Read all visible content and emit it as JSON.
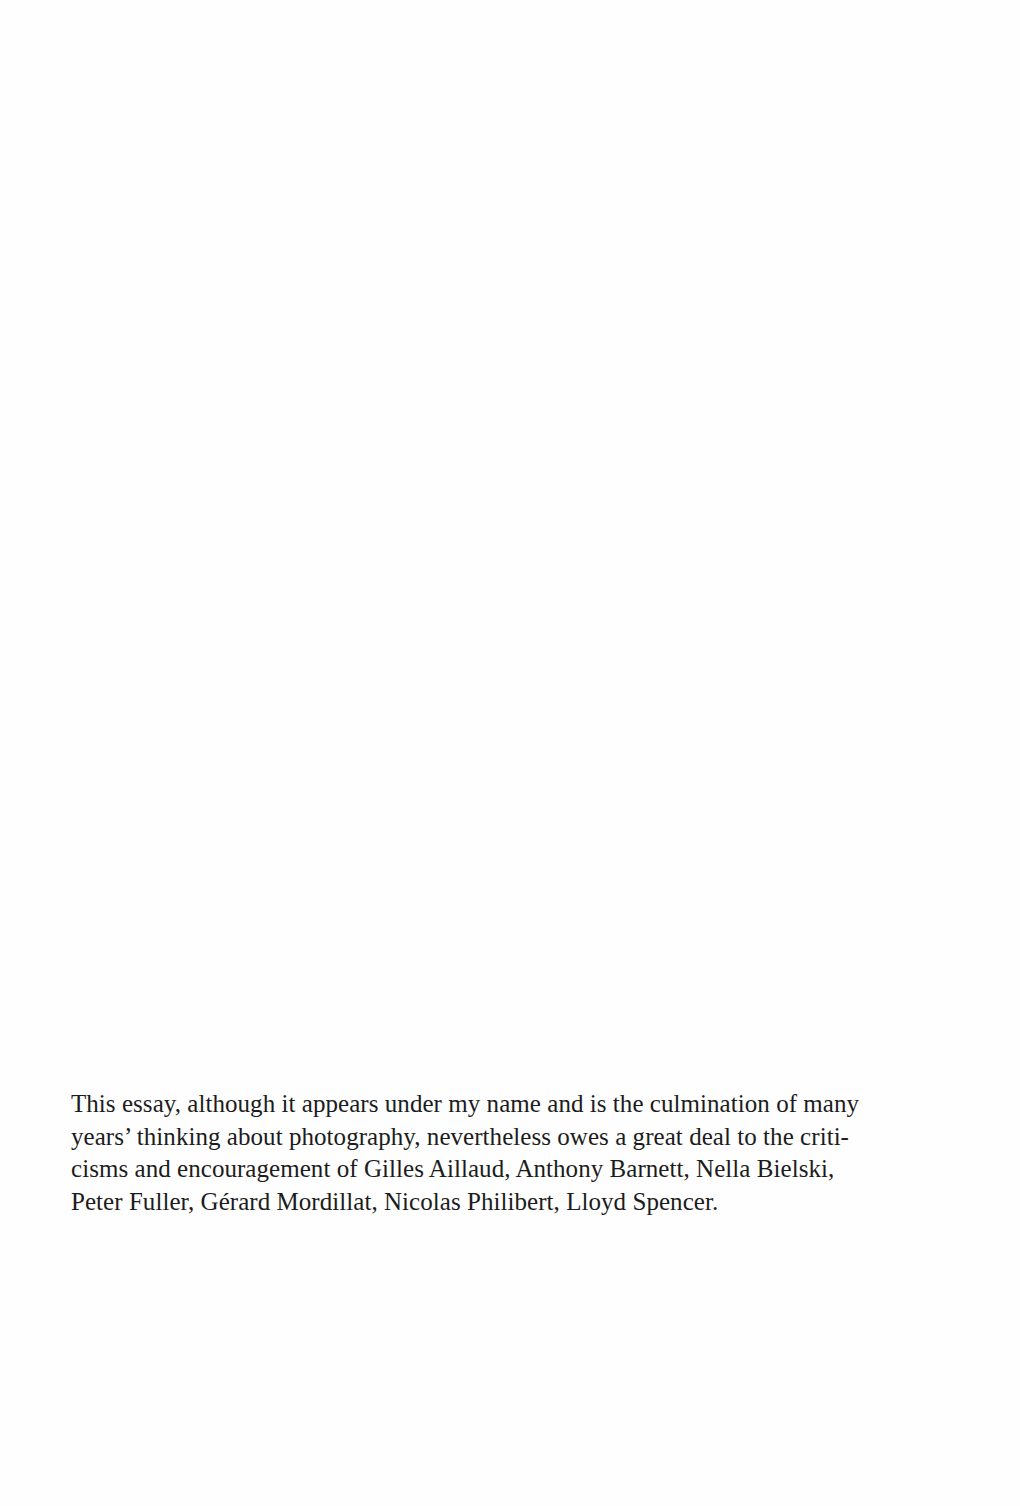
{
  "page": {
    "background": "#ffffff",
    "text_color": "#1c1c1c"
  },
  "acknowledgement": {
    "full_text": "This essay, although it appears under my name and is the culmination of many years' thinking about photography, nevertheless owes a great deal to the criticisms and encouragement of Gilles Aillaud, Anthony Barnett, Nella Bielski, Peter Fuller, Gérard Mordillat, Nicolas Philibert, Lloyd Spencer.",
    "lines": [
      "This essay, although it appears under my name and is the culmination of many",
      "years’ thinking about photography, nevertheless owes a great deal to the criti-",
      "cisms and encouragement of Gilles Aillaud, Anthony Barnett, Nella Bielski,",
      "Peter Fuller, Gérard Mordillat, Nicolas Philibert, Lloyd Spencer."
    ],
    "names": [
      "Gilles Aillaud",
      "Anthony Barnett",
      "Nella Bielski",
      "Peter Fuller",
      "Gérard Mordillat",
      "Nicolas Philibert",
      "Lloyd Spencer"
    ]
  }
}
